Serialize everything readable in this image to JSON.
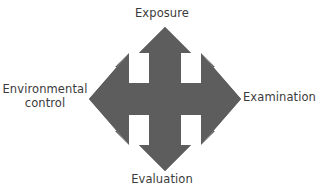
{
  "diagram": {
    "type": "four-way-arrow-cycle",
    "shape_color": "#5d5d5d",
    "background_color": "#ffffff",
    "text_color": "#3b3b3b",
    "labels": {
      "top": "Exposure",
      "right": "Examination",
      "bottom": "Evaluation",
      "left": "Environmental\ncontrol"
    }
  }
}
